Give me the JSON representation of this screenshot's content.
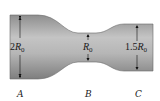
{
  "diagram": {
    "type": "pipe-cross-section",
    "colors": {
      "pipe_fill_light": "#bdbdbd",
      "pipe_fill_dark": "#8c8c8c",
      "pipe_edge": "#6a6a6a",
      "arrow": "#111111",
      "background": "#ffffff"
    },
    "sections": [
      {
        "id": "A",
        "label": "A",
        "dimension": {
          "prefix": "2",
          "symbol": "R",
          "subscript": "0"
        }
      },
      {
        "id": "B",
        "label": "B",
        "dimension": {
          "prefix": "",
          "symbol": "R",
          "subscript": "0"
        }
      },
      {
        "id": "C",
        "label": "C",
        "dimension": {
          "prefix": "1.5",
          "symbol": "R",
          "subscript": "0"
        }
      }
    ]
  }
}
